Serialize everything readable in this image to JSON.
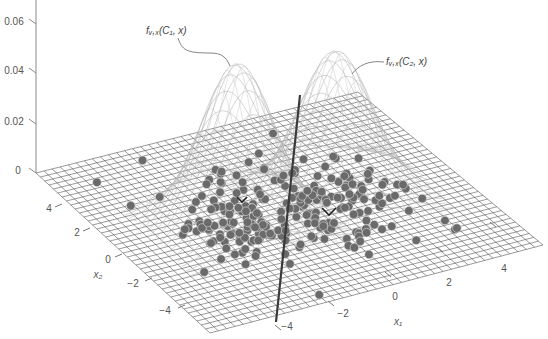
{
  "chart_data": {
    "type": "surface3d+scatter",
    "title": "",
    "xlabel": "x1",
    "ylabel": "x2",
    "zlabel": "",
    "x_ticks": [
      "-4",
      "-2",
      "0",
      "2",
      "4"
    ],
    "y_ticks": [
      "4",
      "2",
      "0",
      "-2",
      "-4"
    ],
    "z_ticks": [
      "0",
      "0.02",
      "0.04",
      "0.06"
    ],
    "xlim": [
      -5,
      5
    ],
    "ylim": [
      -5,
      5
    ],
    "zlim": [
      0,
      0.065
    ],
    "grid": true,
    "annotations": [
      {
        "text": "f_{X,x}(C1, x)",
        "label": "fᵥ,ₓ(C₁, x)",
        "target": "left-peak"
      },
      {
        "text": "f_{X,x}(C2, x)",
        "label": "fᵥ,ₓ(C₂, x)",
        "target": "right-peak"
      }
    ],
    "series": [
      {
        "name": "class C1 density",
        "kind": "gaussian-surface",
        "mean": [
          -1.5,
          0
        ],
        "peak": 0.063
      },
      {
        "name": "class C2 density",
        "kind": "gaussian-surface",
        "mean": [
          1.5,
          0
        ],
        "peak": 0.058
      },
      {
        "name": "class C1 samples",
        "kind": "scatter",
        "center": [
          -1.5,
          0
        ],
        "count": 120,
        "marker_mean": "v"
      },
      {
        "name": "class C2 samples",
        "kind": "scatter",
        "center": [
          1.5,
          0
        ],
        "count": 120,
        "marker_mean": "v"
      },
      {
        "name": "decision boundary",
        "kind": "line",
        "x1": 0
      }
    ]
  },
  "labels": {
    "z0": "0",
    "z1": "0.02",
    "z2": "0.04",
    "z3": "0.06",
    "x2_4": "4",
    "x2_2": "2",
    "x2_0": "0",
    "x2_m2": "−2",
    "x2_m4": "−4",
    "x1_m4": "−4",
    "x1_m2": "−2",
    "x1_0": "0",
    "x1_2": "2",
    "x1_4": "4",
    "x1_title": "x₁",
    "x2_title": "x₂",
    "annot1": "fᵥ,ₓ(C₁, x)",
    "annot2": "fᵥ,ₓ(C₂, x)"
  },
  "colors": {
    "grid": "#555555",
    "peak": "#b5b5b5",
    "dots": "#6a6a6a",
    "boundary": "#3a3a3a",
    "axis": "#8a8a8a"
  }
}
